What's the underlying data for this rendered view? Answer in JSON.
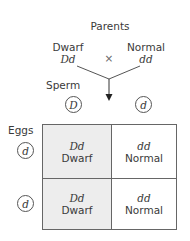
{
  "title": "Parents",
  "parents": {
    "left": {
      "phenotype": "Dwarf",
      "genotype": "Dd"
    },
    "cross_symbol": "×",
    "right": {
      "phenotype": "Normal",
      "genotype": "dd"
    }
  },
  "sperm": {
    "label": "Sperm",
    "alleles": [
      "D",
      "d"
    ]
  },
  "eggs": {
    "label": "Eggs",
    "alleles": [
      "d",
      "d"
    ]
  },
  "punnett": {
    "rows": [
      [
        {
          "genotype": "Dd",
          "phenotype": "Dwarf"
        },
        {
          "genotype": "dd",
          "phenotype": "Normal"
        }
      ],
      [
        {
          "genotype": "Dd",
          "phenotype": "Dwarf"
        },
        {
          "genotype": "dd",
          "phenotype": "Normal"
        }
      ]
    ]
  },
  "colors": {
    "dwarf_cell": "#ededed",
    "normal_cell": "#ffffff",
    "lines": "#555555"
  }
}
